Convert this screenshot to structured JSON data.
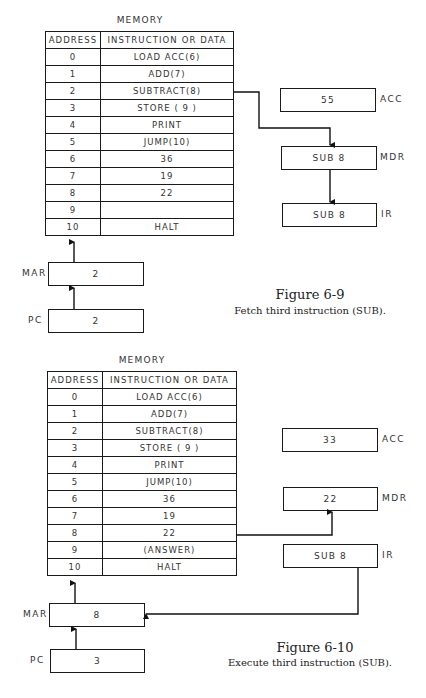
{
  "figures": [
    {
      "memory_title": "MEMORY",
      "columns": [
        "ADDRESS",
        "INSTRUCTION OR DATA"
      ],
      "rows": [
        {
          "address": "0",
          "content": "LOAD ACC(6)"
        },
        {
          "address": "1",
          "content": "ADD(7)"
        },
        {
          "address": "2",
          "content": "SUBTRACT(8)"
        },
        {
          "address": "3",
          "content": "STORE ( 9 )"
        },
        {
          "address": "4",
          "content": "PRINT"
        },
        {
          "address": "5",
          "content": "JUMP(10)"
        },
        {
          "address": "6",
          "content": "36"
        },
        {
          "address": "7",
          "content": "19"
        },
        {
          "address": "8",
          "content": "22"
        },
        {
          "address": "9",
          "content": ""
        },
        {
          "address": "10",
          "content": "HALT"
        }
      ],
      "registers": {
        "mar": {
          "label": "MAR",
          "value": "2"
        },
        "pc": {
          "label": "PC",
          "value": "2"
        },
        "acc": {
          "label": "ACC",
          "value": "55"
        },
        "mdr": {
          "label": "MDR",
          "value": "SUB 8"
        },
        "ir": {
          "label": "IR",
          "value": "SUB 8"
        }
      },
      "title": "Figure 6-9",
      "caption": "Fetch third instruction (SUB)."
    },
    {
      "memory_title": "MEMORY",
      "columns": [
        "ADDRESS",
        "INSTRUCTION OR DATA"
      ],
      "rows": [
        {
          "address": "0",
          "content": "LOAD ACC(6)"
        },
        {
          "address": "1",
          "content": "ADD(7)"
        },
        {
          "address": "2",
          "content": "SUBTRACT(8)"
        },
        {
          "address": "3",
          "content": "STORE ( 9 )"
        },
        {
          "address": "4",
          "content": "PRINT"
        },
        {
          "address": "5",
          "content": "JUMP(10)"
        },
        {
          "address": "6",
          "content": "36"
        },
        {
          "address": "7",
          "content": "19"
        },
        {
          "address": "8",
          "content": "22"
        },
        {
          "address": "9",
          "content": "(ANSWER)"
        },
        {
          "address": "10",
          "content": "HALT"
        }
      ],
      "registers": {
        "mar": {
          "label": "MAR",
          "value": "8"
        },
        "pc": {
          "label": "PC",
          "value": "3"
        },
        "acc": {
          "label": "ACC",
          "value": "33"
        },
        "mdr": {
          "label": "MDR",
          "value": "22"
        },
        "ir": {
          "label": "IR",
          "value": "SUB 8"
        }
      },
      "title": "Figure 6-10",
      "caption": "Execute third instruction (SUB)."
    }
  ]
}
